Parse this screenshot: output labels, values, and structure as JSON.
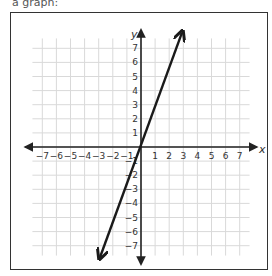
{
  "header": {
    "cutoff_text": "a graph:"
  },
  "chart_data": {
    "type": "line",
    "title": "",
    "xlabel": "x",
    "ylabel": "y",
    "xlim": [
      -7,
      7
    ],
    "ylim": [
      -7,
      7
    ],
    "grid": true,
    "x_ticks": [
      "-7",
      "-6",
      "-5",
      "-4",
      "-3",
      "-2",
      "-1",
      "1",
      "2",
      "3",
      "4",
      "5",
      "6",
      "7"
    ],
    "y_ticks": [
      "7",
      "6",
      "5",
      "4",
      "3",
      "2",
      "1",
      "-1",
      "-2",
      "-3",
      "-4",
      "-5",
      "-6",
      "-7"
    ],
    "series": [
      {
        "name": "line",
        "equation": "y = 3x (approx.)",
        "points": [
          [
            -2.9,
            -7.8
          ],
          [
            0,
            0
          ],
          [
            2.9,
            8.1
          ]
        ],
        "arrows": "both",
        "color": "#1a1a1a"
      }
    ],
    "axes_arrows": true
  },
  "colors": {
    "grid": "#d9d9d9",
    "axis": "#222222",
    "line": "#1a1a1a",
    "frame": "#333333",
    "label": "#333333"
  }
}
